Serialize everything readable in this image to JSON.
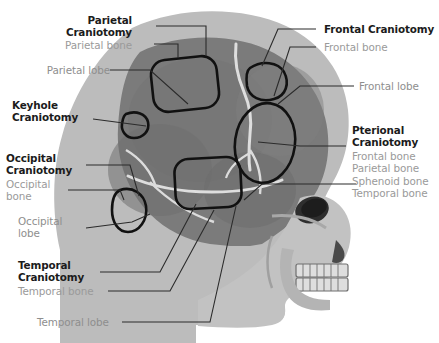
{
  "figure": {
    "type": "anatomical-diagram",
    "palette": {
      "background": "#ffffff",
      "scalp_light_gray": "#b9b9b9",
      "skull_mid_gray": "#7e7e7e",
      "skull_dark_gray": "#6a6a6a",
      "suture_line": "#dcdcdc",
      "facial_bone_light": "#c9c9c9",
      "outline_black": "#111111",
      "title_text": "#1b1b1b",
      "subtitle_text": "#9a9a9a",
      "leader_line": "#2b2b2b"
    }
  },
  "annotations": [
    {
      "id": "parietal-craniotomy",
      "title": "Parietal\nCraniotomy",
      "bones": [
        "Parietal bone"
      ],
      "side": "left"
    },
    {
      "id": "parietal-lobe",
      "title": "",
      "bones": [
        "Parietal lobe"
      ],
      "side": "left"
    },
    {
      "id": "keyhole-craniotomy",
      "title": "Keyhole\nCraniotomy",
      "bones": [],
      "side": "left"
    },
    {
      "id": "occipital-craniotomy",
      "title": "Occipital\nCraniotomy",
      "bones": [
        "Occipital\nbone"
      ],
      "side": "left"
    },
    {
      "id": "occipital-lobe",
      "title": "",
      "bones": [
        "Occipital\nlobe"
      ],
      "side": "left"
    },
    {
      "id": "temporal-craniotomy",
      "title": "Temporal\nCraniotomy",
      "bones": [
        "Temporal bone"
      ],
      "side": "left"
    },
    {
      "id": "temporal-lobe",
      "title": "",
      "bones": [
        "Temporal lobe"
      ],
      "side": "left"
    },
    {
      "id": "frontal-craniotomy",
      "title": "Frontal Craniotomy",
      "bones": [
        "Frontal bone"
      ],
      "side": "right"
    },
    {
      "id": "frontal-lobe",
      "title": "",
      "bones": [
        "Frontal lobe"
      ],
      "side": "right"
    },
    {
      "id": "pterional-craniotomy",
      "title": "Pterional\nCraniotomy",
      "bones": [
        "Frontal bone",
        "Parietal bone",
        "Sphenoid bone",
        "Temporal bone"
      ],
      "side": "right"
    }
  ],
  "labels": {
    "parietal_craniotomy_l1": "Parietal",
    "parietal_craniotomy_l2": "Craniotomy",
    "parietal_bone": "Parietal bone",
    "parietal_lobe": "Parietal lobe",
    "keyhole_l1": "Keyhole",
    "keyhole_l2": "Craniotomy",
    "occipital_l1": "Occipital",
    "occipital_l2": "Craniotomy",
    "occipital_bone_l1": "Occipital",
    "occipital_bone_l2": "bone",
    "occipital_lobe_l1": "Occipital",
    "occipital_lobe_l2": "lobe",
    "temporal_l1": "Temporal",
    "temporal_l2": "Craniotomy",
    "temporal_bone": "Temporal bone",
    "temporal_lobe": "Temporal lobe",
    "frontal_craniotomy": "Frontal Craniotomy",
    "frontal_bone": "Frontal bone",
    "frontal_lobe": "Frontal lobe",
    "pterional_l1": "Pterional",
    "pterional_l2": "Craniotomy",
    "pterional_bone_1": "Frontal bone",
    "pterional_bone_2": "Parietal bone",
    "pterional_bone_3": "Sphenoid bone",
    "pterional_bone_4": "Temporal bone"
  },
  "craniotomy_sites": [
    {
      "name": "parietal",
      "shape": "rounded-rectangle",
      "cx": 184,
      "cy": 84
    },
    {
      "name": "keyhole",
      "shape": "small-oval",
      "cx": 135,
      "cy": 125
    },
    {
      "name": "frontal",
      "shape": "rounded-oval",
      "cx": 266,
      "cy": 80
    },
    {
      "name": "pterional",
      "shape": "tall-oval",
      "cx": 265,
      "cy": 143
    },
    {
      "name": "temporal",
      "shape": "rounded-rectangle",
      "cx": 207,
      "cy": 183
    },
    {
      "name": "occipital",
      "shape": "small-oval",
      "cx": 130,
      "cy": 212
    }
  ]
}
